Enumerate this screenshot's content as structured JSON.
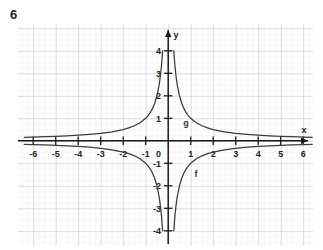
{
  "exercise": {
    "number": "6"
  },
  "figure": {
    "origin_label": "0",
    "x_axis_label": "x",
    "y_axis_label": "y",
    "curve_labels": [
      {
        "name": "f",
        "text": "f",
        "x": 196,
        "y": 177
      },
      {
        "name": "g",
        "text": "g",
        "x": 186,
        "y": 126
      }
    ],
    "colors": {
      "grid_minor": "#e3e3e8",
      "grid_major": "#b9b9c2",
      "axis": "#1a1a1a",
      "curve": "#3b3b3b",
      "text": "#231f20",
      "background": "#ffffff"
    }
  },
  "chart_data": {
    "type": "line",
    "title": "",
    "xlabel": "x",
    "ylabel": "y",
    "grid": true,
    "legend": "inline-curve-labels",
    "xlim": [
      -6.5,
      6.5
    ],
    "ylim": [
      -4.4,
      4.6
    ],
    "xticks": [
      -6,
      -5,
      -4,
      -3,
      -2,
      -1,
      1,
      2,
      3,
      4,
      5,
      6
    ],
    "xtick_labels": [
      "-6",
      "-5",
      "-4",
      "-3",
      "-2",
      "-1",
      "1",
      "2",
      "3",
      "4",
      "5",
      "6"
    ],
    "yticks": [
      -4,
      -3,
      -2,
      -1,
      1,
      2,
      3,
      4
    ],
    "ytick_labels": [
      "-4",
      "-3",
      "-2",
      "-1",
      "1",
      "2",
      "3",
      "4"
    ],
    "origin_label": "0",
    "series": [
      {
        "name": "f",
        "label": "f",
        "equation": "y = 1/x",
        "asymptotes": {
          "vertical": 0,
          "horizontal": 0
        },
        "branches": [
          {
            "quadrant": "III",
            "x": [
              -6.4,
              -6,
              -5.5,
              -5,
              -4.5,
              -4,
              -3.5,
              -3,
              -2.5,
              -2,
              -1.75,
              -1.5,
              -1.25,
              -1,
              -0.9,
              -0.8,
              -0.7,
              -0.6,
              -0.5,
              -0.4,
              -0.35,
              -0.3,
              -0.27,
              -0.25
            ],
            "y": [
              -0.156,
              -0.167,
              -0.182,
              -0.2,
              -0.222,
              -0.25,
              -0.286,
              -0.333,
              -0.4,
              -0.5,
              -0.571,
              -0.667,
              -0.8,
              -1.0,
              -1.111,
              -1.25,
              -1.429,
              -1.667,
              -2.0,
              -2.5,
              -2.857,
              -3.333,
              -3.704,
              -4.0
            ]
          },
          {
            "quadrant": "I",
            "x": [
              0.25,
              0.27,
              0.3,
              0.35,
              0.4,
              0.5,
              0.6,
              0.7,
              0.8,
              0.9,
              1.0,
              1.25,
              1.5,
              1.75,
              2,
              2.5,
              3,
              3.5,
              4,
              4.5,
              5,
              5.5,
              6,
              6.4
            ],
            "y": [
              4.0,
              3.704,
              3.333,
              2.857,
              2.5,
              2.0,
              1.667,
              1.429,
              1.25,
              1.111,
              1.0,
              0.8,
              0.667,
              0.571,
              0.5,
              0.4,
              0.333,
              0.286,
              0.25,
              0.222,
              0.2,
              0.182,
              0.167,
              0.156
            ]
          }
        ]
      },
      {
        "name": "g",
        "label": "g",
        "equation": "y = -1/x",
        "asymptotes": {
          "vertical": 0,
          "horizontal": 0
        },
        "branches": [
          {
            "quadrant": "II",
            "x": [
              -6.4,
              -6,
              -5.5,
              -5,
              -4.5,
              -4,
              -3.5,
              -3,
              -2.5,
              -2,
              -1.75,
              -1.5,
              -1.25,
              -1,
              -0.9,
              -0.8,
              -0.7,
              -0.6,
              -0.5,
              -0.4,
              -0.35,
              -0.3,
              -0.27,
              -0.25
            ],
            "y": [
              0.156,
              0.167,
              0.182,
              0.2,
              0.222,
              0.25,
              0.286,
              0.333,
              0.4,
              0.5,
              0.571,
              0.667,
              0.8,
              1.0,
              1.111,
              1.25,
              1.429,
              1.667,
              2.0,
              2.5,
              2.857,
              3.333,
              3.704,
              4.0
            ]
          },
          {
            "quadrant": "IV",
            "x": [
              0.25,
              0.27,
              0.3,
              0.35,
              0.4,
              0.5,
              0.6,
              0.7,
              0.8,
              0.9,
              1.0,
              1.25,
              1.5,
              1.75,
              2,
              2.5,
              3,
              3.5,
              4,
              4.5,
              5,
              5.5,
              6,
              6.4
            ],
            "y": [
              -4.0,
              -3.704,
              -3.333,
              -2.857,
              -2.5,
              -2.0,
              -1.667,
              -1.429,
              -1.25,
              -1.111,
              -1.0,
              -0.8,
              -0.667,
              -0.571,
              -0.5,
              -0.4,
              -0.333,
              -0.286,
              -0.25,
              -0.222,
              -0.2,
              -0.182,
              -0.167,
              -0.156
            ]
          }
        ]
      }
    ]
  }
}
